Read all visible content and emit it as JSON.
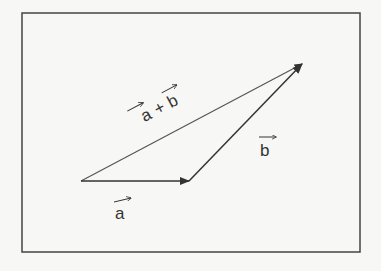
{
  "diagram": {
    "colors": {
      "frame": "#444444",
      "vector": "#333333",
      "background": "#f7f7f5"
    },
    "vectors": [
      {
        "id": "a",
        "label": "a",
        "from": [
          81,
          181
        ],
        "to": [
          189,
          181
        ]
      },
      {
        "id": "b",
        "label": "b",
        "from": [
          189,
          181
        ],
        "to": [
          302,
          64
        ]
      },
      {
        "id": "sum",
        "label": "a + b",
        "from": [
          81,
          181
        ],
        "to": [
          302,
          64
        ]
      }
    ],
    "labels": {
      "a": "a",
      "b": "b",
      "sum_a": "a",
      "sum_plus": "+",
      "sum_b": "b"
    }
  }
}
